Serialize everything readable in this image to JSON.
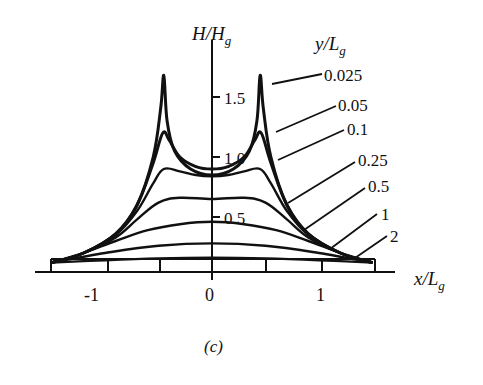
{
  "chart_data": {
    "type": "line",
    "title": "",
    "caption": "(c)",
    "xlabel": "x/L_g",
    "ylabel": "H/H_g",
    "legend_title": "y/L_g",
    "xlim": [
      -1.5,
      1.5
    ],
    "ylim": [
      0,
      1.75
    ],
    "x_ticks": [
      -1,
      -0.5,
      0,
      0.5,
      1,
      1.5
    ],
    "x_tick_labels": [
      "-1",
      "0",
      "1"
    ],
    "y_ticks": [
      0.5,
      1.0,
      1.5
    ],
    "y_tick_labels": [
      "0.5",
      "1.0",
      "1.5"
    ],
    "grid": false,
    "legend_position": "right, with leader lines to curves",
    "series": [
      {
        "name": "0.025",
        "x": [
          -1.5,
          -1.2,
          -0.9,
          -0.7,
          -0.55,
          -0.48,
          -0.45,
          -0.42,
          -0.35,
          -0.2,
          0,
          0.2,
          0.35,
          0.42,
          0.45,
          0.48,
          0.55,
          0.7,
          0.9,
          1.2,
          1.5
        ],
        "y": [
          0.12,
          0.2,
          0.36,
          0.6,
          1.0,
          1.4,
          1.68,
          1.3,
          1.05,
          0.9,
          0.85,
          0.9,
          1.05,
          1.3,
          1.68,
          1.4,
          1.0,
          0.6,
          0.36,
          0.2,
          0.12
        ]
      },
      {
        "name": "0.05",
        "x": [
          -1.5,
          -1.2,
          -0.9,
          -0.7,
          -0.55,
          -0.46,
          -0.4,
          -0.3,
          -0.15,
          0,
          0.15,
          0.3,
          0.4,
          0.46,
          0.55,
          0.7,
          0.9,
          1.2,
          1.5
        ],
        "y": [
          0.12,
          0.2,
          0.36,
          0.6,
          0.95,
          1.2,
          1.14,
          1.0,
          0.92,
          0.9,
          0.92,
          1.0,
          1.14,
          1.2,
          0.95,
          0.6,
          0.36,
          0.2,
          0.12
        ]
      },
      {
        "name": "0.1",
        "x": [
          -1.5,
          -1.2,
          -0.9,
          -0.7,
          -0.55,
          -0.45,
          -0.3,
          -0.15,
          0,
          0.15,
          0.3,
          0.45,
          0.55,
          0.7,
          0.9,
          1.2,
          1.5
        ],
        "y": [
          0.12,
          0.2,
          0.35,
          0.55,
          0.78,
          0.9,
          0.88,
          0.85,
          0.84,
          0.85,
          0.88,
          0.9,
          0.78,
          0.55,
          0.35,
          0.2,
          0.12
        ]
      },
      {
        "name": "0.25",
        "x": [
          -1.5,
          -1.2,
          -0.9,
          -0.7,
          -0.5,
          -0.3,
          0,
          0.3,
          0.5,
          0.7,
          0.9,
          1.2,
          1.5
        ],
        "y": [
          0.12,
          0.2,
          0.33,
          0.48,
          0.62,
          0.66,
          0.65,
          0.66,
          0.62,
          0.48,
          0.33,
          0.2,
          0.12
        ]
      },
      {
        "name": "0.5",
        "x": [
          -1.5,
          -1.2,
          -0.9,
          -0.6,
          -0.3,
          0,
          0.3,
          0.6,
          0.9,
          1.2,
          1.5
        ],
        "y": [
          0.12,
          0.2,
          0.3,
          0.39,
          0.44,
          0.46,
          0.44,
          0.39,
          0.3,
          0.2,
          0.12
        ]
      },
      {
        "name": "1",
        "x": [
          -1.5,
          -1.0,
          -0.5,
          0,
          0.5,
          1.0,
          1.5
        ],
        "y": [
          0.12,
          0.2,
          0.26,
          0.28,
          0.26,
          0.2,
          0.12
        ]
      },
      {
        "name": "2",
        "x": [
          -1.5,
          -1.0,
          -0.5,
          0,
          0.5,
          1.0,
          1.5
        ],
        "y": [
          0.12,
          0.14,
          0.155,
          0.16,
          0.155,
          0.14,
          0.12
        ]
      }
    ]
  }
}
